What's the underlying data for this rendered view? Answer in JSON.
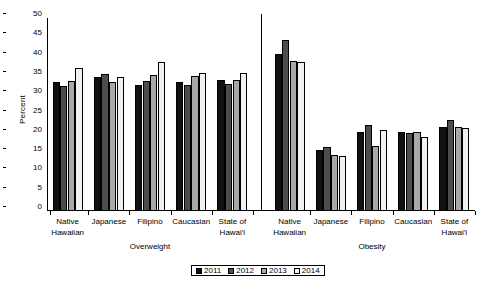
{
  "chart_data": {
    "type": "bar",
    "title": "",
    "xlabel": "",
    "ylabel": "Percent",
    "ylim": [
      0,
      50
    ],
    "yticks": [
      0,
      5,
      10,
      15,
      20,
      25,
      30,
      35,
      40,
      45,
      50
    ],
    "grid": false,
    "legend_position": "bottom",
    "sections": [
      "Overweight",
      "Obesity"
    ],
    "categories": [
      "Native Hawaiian",
      "Japanese",
      "Filipino",
      "Caucasian",
      "State of Hawai'i"
    ],
    "category_lines": [
      [
        "Native",
        "Hawaiian"
      ],
      [
        "Japanese",
        ""
      ],
      [
        "Filipino",
        ""
      ],
      [
        "Caucasian",
        ""
      ],
      [
        "State of",
        "Hawai'i"
      ]
    ],
    "series": [
      {
        "name": "2011",
        "color": "#111111",
        "overweight": [
          33.4,
          34.8,
          32.6,
          33.4,
          34.0
        ],
        "obesity": [
          40.6,
          15.9,
          20.4,
          20.5,
          21.7
        ]
      },
      {
        "name": "2012",
        "color": "#4d4d4d",
        "overweight": [
          32.4,
          35.4,
          33.6,
          32.6,
          33.0
        ],
        "obesity": [
          44.2,
          16.6,
          22.4,
          20.2,
          23.7
        ]
      },
      {
        "name": "2013",
        "color": "#a8a8a8",
        "overweight": [
          33.6,
          33.4,
          35.2,
          35.0,
          34.0
        ],
        "obesity": [
          38.8,
          14.4,
          16.8,
          20.4,
          21.8
        ]
      },
      {
        "name": "2014",
        "color": "#f1f1f1",
        "overweight": [
          37.0,
          34.7,
          38.5,
          35.7,
          35.7
        ],
        "obesity": [
          38.6,
          14.2,
          21.0,
          19.2,
          21.6
        ]
      }
    ]
  },
  "axis": {
    "y_title": "Percent"
  },
  "legend": {
    "items": [
      {
        "label": "2011",
        "color": "#111111"
      },
      {
        "label": "2012",
        "color": "#4d4d4d"
      },
      {
        "label": "2013",
        "color": "#a8a8a8"
      },
      {
        "label": "2014",
        "color": "#f1f1f1"
      }
    ]
  }
}
